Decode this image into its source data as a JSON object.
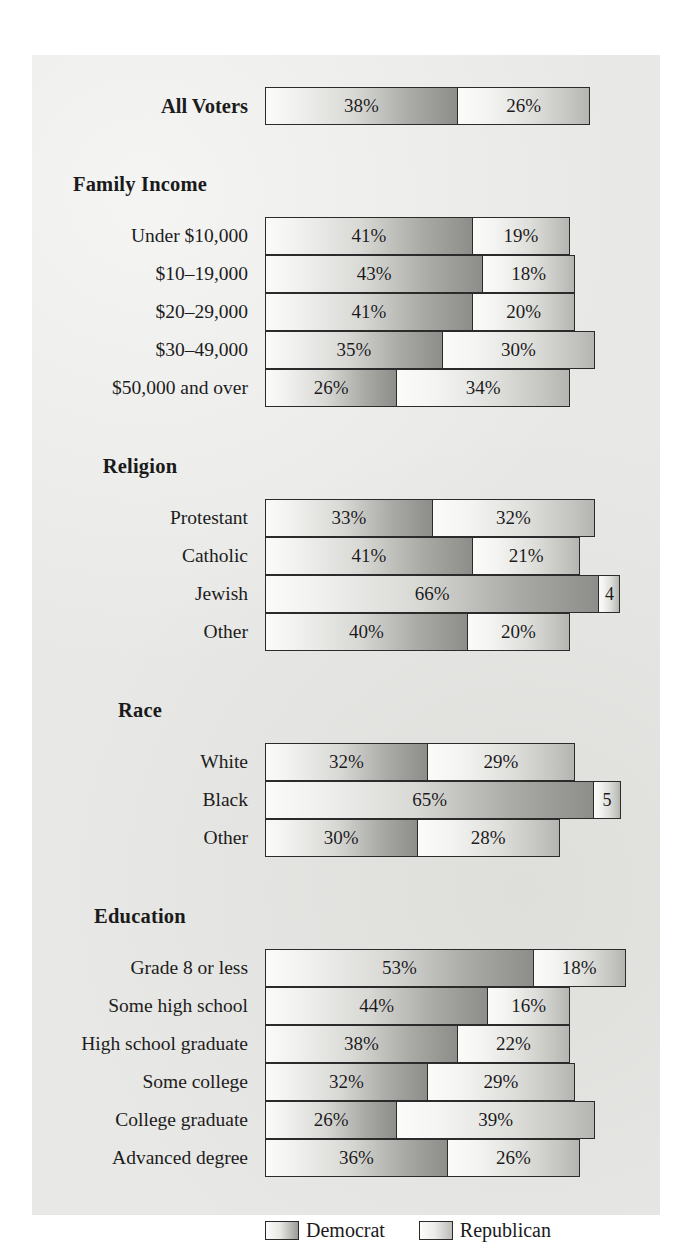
{
  "legend": {
    "items": [
      {
        "label": "Democrat",
        "key": "dem",
        "color": "#8d8d8a"
      },
      {
        "label": "Republican",
        "key": "rep",
        "color": "#b4b4b1"
      }
    ]
  },
  "chart_data": {
    "type": "bar",
    "subtype": "stacked-horizontal",
    "title": "",
    "xlabel": "",
    "ylabel": "",
    "unit": "%",
    "px_per_percent": 5.05,
    "series": [
      {
        "name": "Democrat",
        "key": "dem"
      },
      {
        "name": "Republican",
        "key": "rep"
      }
    ],
    "groups": [
      {
        "header": "",
        "rows": [
          {
            "label": "All Voters",
            "bold": true,
            "dem": 38,
            "rep": 26,
            "dem_text": "38%",
            "rep_text": "26%"
          }
        ]
      },
      {
        "header": "Family Income",
        "rows": [
          {
            "label": "Under $10,000",
            "bold": false,
            "dem": 41,
            "rep": 19,
            "dem_text": "41%",
            "rep_text": "19%"
          },
          {
            "label": "$10–19,000",
            "bold": false,
            "dem": 43,
            "rep": 18,
            "dem_text": "43%",
            "rep_text": "18%"
          },
          {
            "label": "$20–29,000",
            "bold": false,
            "dem": 41,
            "rep": 20,
            "dem_text": "41%",
            "rep_text": "20%"
          },
          {
            "label": "$30–49,000",
            "bold": false,
            "dem": 35,
            "rep": 30,
            "dem_text": "35%",
            "rep_text": "30%"
          },
          {
            "label": "$50,000 and over",
            "bold": false,
            "dem": 26,
            "rep": 34,
            "dem_text": "26%",
            "rep_text": "34%"
          }
        ]
      },
      {
        "header": "Religion",
        "rows": [
          {
            "label": "Protestant",
            "bold": false,
            "dem": 33,
            "rep": 32,
            "dem_text": "33%",
            "rep_text": "32%"
          },
          {
            "label": "Catholic",
            "bold": false,
            "dem": 41,
            "rep": 21,
            "dem_text": "41%",
            "rep_text": "21%"
          },
          {
            "label": "Jewish",
            "bold": false,
            "dem": 66,
            "rep": 4,
            "dem_text": "66%",
            "rep_text": "4"
          },
          {
            "label": "Other",
            "bold": false,
            "dem": 40,
            "rep": 20,
            "dem_text": "40%",
            "rep_text": "20%"
          }
        ]
      },
      {
        "header": "Race",
        "rows": [
          {
            "label": "White",
            "bold": false,
            "dem": 32,
            "rep": 29,
            "dem_text": "32%",
            "rep_text": "29%"
          },
          {
            "label": "Black",
            "bold": false,
            "dem": 65,
            "rep": 5,
            "dem_text": "65%",
            "rep_text": "5"
          },
          {
            "label": "Other",
            "bold": false,
            "dem": 30,
            "rep": 28,
            "dem_text": "30%",
            "rep_text": "28%"
          }
        ]
      },
      {
        "header": "Education",
        "rows": [
          {
            "label": "Grade 8 or less",
            "bold": false,
            "dem": 53,
            "rep": 18,
            "dem_text": "53%",
            "rep_text": "18%"
          },
          {
            "label": "Some high school",
            "bold": false,
            "dem": 44,
            "rep": 16,
            "dem_text": "44%",
            "rep_text": "16%"
          },
          {
            "label": "High school graduate",
            "bold": false,
            "dem": 38,
            "rep": 22,
            "dem_text": "38%",
            "rep_text": "22%"
          },
          {
            "label": "Some college",
            "bold": false,
            "dem": 32,
            "rep": 29,
            "dem_text": "32%",
            "rep_text": "29%"
          },
          {
            "label": "College graduate",
            "bold": false,
            "dem": 26,
            "rep": 39,
            "dem_text": "26%",
            "rep_text": "39%"
          },
          {
            "label": "Advanced degree",
            "bold": false,
            "dem": 36,
            "rep": 26,
            "dem_text": "36%",
            "rep_text": "26%"
          }
        ]
      }
    ]
  }
}
